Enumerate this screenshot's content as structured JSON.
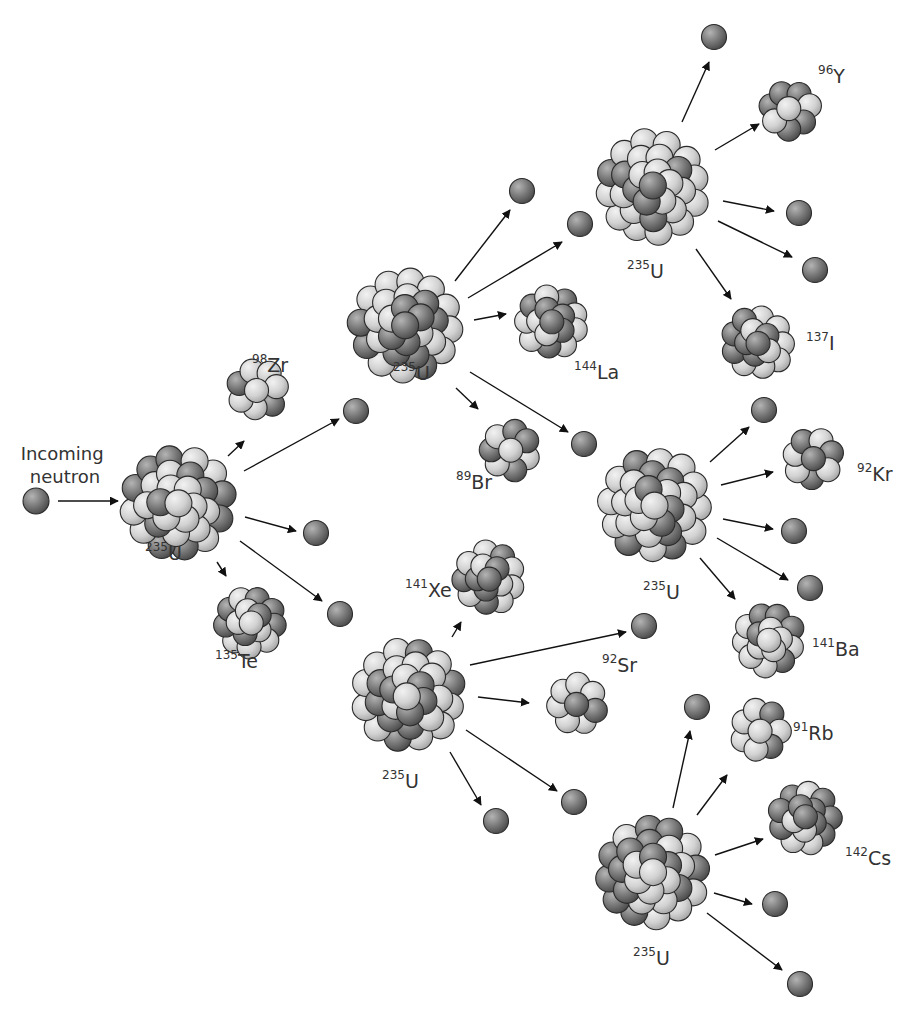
{
  "colors": {
    "background": "#ffffff",
    "proton_light": "#d6d6d6",
    "neutron_dark": "#7a7a7a",
    "outline": "#2a2a2a",
    "arrow": "#111111",
    "label": "#333333"
  },
  "caption": {
    "line1": "Incoming",
    "line2": "neutron",
    "x": 65,
    "y1": 460,
    "y2": 483
  },
  "incoming_neutron": {
    "x": 36,
    "y": 501
  },
  "nuclei": [
    {
      "id": "u1",
      "type": "large",
      "x": 178,
      "y": 503,
      "mass": "235",
      "symbol": "U",
      "lx": 145,
      "ly": 560
    },
    {
      "id": "zr98",
      "type": "small",
      "x": 258,
      "y": 390,
      "mass": "98",
      "symbol": "Zr",
      "lx": 252,
      "ly": 372
    },
    {
      "id": "te135",
      "type": "medium",
      "x": 250,
      "y": 622,
      "mass": "135",
      "symbol": "Te",
      "lx": 215,
      "ly": 668
    },
    {
      "id": "u2",
      "type": "large",
      "x": 406,
      "y": 326,
      "mass": "235",
      "symbol": "U",
      "lx": 393,
      "ly": 380
    },
    {
      "id": "la144",
      "type": "medium",
      "x": 552,
      "y": 322,
      "mass": "144",
      "symbol": "La",
      "lx": 574,
      "ly": 379
    },
    {
      "id": "br89",
      "type": "small",
      "x": 510,
      "y": 450,
      "mass": "89",
      "symbol": "Br",
      "lx": 456,
      "ly": 489
    },
    {
      "id": "u3",
      "type": "large",
      "x": 652,
      "y": 187,
      "mass": "235",
      "symbol": "U",
      "lx": 627,
      "ly": 278
    },
    {
      "id": "y96",
      "type": "small",
      "x": 790,
      "y": 110,
      "mass": "96",
      "symbol": "Y",
      "lx": 818,
      "ly": 83
    },
    {
      "id": "i137",
      "type": "medium",
      "x": 758,
      "y": 343,
      "mass": "137",
      "symbol": "I",
      "lx": 806,
      "ly": 350
    },
    {
      "id": "u4",
      "type": "large",
      "x": 655,
      "y": 505,
      "mass": "235",
      "symbol": "U",
      "lx": 643,
      "ly": 599
    },
    {
      "id": "kr92",
      "type": "small",
      "x": 813,
      "y": 458,
      "mass": "92",
      "symbol": "Kr",
      "lx": 857,
      "ly": 481
    },
    {
      "id": "ba141",
      "type": "medium",
      "x": 768,
      "y": 640,
      "mass": "141",
      "symbol": "Ba",
      "lx": 812,
      "ly": 656
    },
    {
      "id": "xe141",
      "type": "medium",
      "x": 489,
      "y": 578,
      "mass": "141",
      "symbol": "Xe",
      "lx": 405,
      "ly": 597
    },
    {
      "id": "u5",
      "type": "large",
      "x": 408,
      "y": 695,
      "mass": "235",
      "symbol": "U",
      "lx": 382,
      "ly": 788
    },
    {
      "id": "sr92",
      "type": "small",
      "x": 577,
      "y": 704,
      "mass": "92",
      "symbol": "Sr",
      "lx": 602,
      "ly": 672
    },
    {
      "id": "rb91",
      "type": "small",
      "x": 760,
      "y": 730,
      "mass": "91",
      "symbol": "Rb",
      "lx": 793,
      "ly": 740
    },
    {
      "id": "cs142",
      "type": "medium",
      "x": 805,
      "y": 818,
      "mass": "142",
      "symbol": "Cs",
      "lx": 845,
      "ly": 865
    },
    {
      "id": "u6",
      "type": "large",
      "x": 652,
      "y": 873,
      "mass": "235",
      "symbol": "U",
      "lx": 633,
      "ly": 965
    }
  ],
  "free_neutrons": [
    {
      "x": 356,
      "y": 411
    },
    {
      "x": 316,
      "y": 533
    },
    {
      "x": 340,
      "y": 614
    },
    {
      "x": 522,
      "y": 191
    },
    {
      "x": 580,
      "y": 224
    },
    {
      "x": 584,
      "y": 444
    },
    {
      "x": 714,
      "y": 37
    },
    {
      "x": 799,
      "y": 213
    },
    {
      "x": 815,
      "y": 270
    },
    {
      "x": 764,
      "y": 410
    },
    {
      "x": 794,
      "y": 531
    },
    {
      "x": 810,
      "y": 588
    },
    {
      "x": 644,
      "y": 626
    },
    {
      "x": 496,
      "y": 821
    },
    {
      "x": 574,
      "y": 802
    },
    {
      "x": 697,
      "y": 707
    },
    {
      "x": 775,
      "y": 904
    },
    {
      "x": 800,
      "y": 984
    }
  ],
  "arrows": [
    {
      "x1": 58,
      "y1": 501,
      "x2": 118,
      "y2": 501
    },
    {
      "x1": 228,
      "y1": 456,
      "x2": 244,
      "y2": 441
    },
    {
      "x1": 244,
      "y1": 471,
      "x2": 339,
      "y2": 419
    },
    {
      "x1": 245,
      "y1": 517,
      "x2": 296,
      "y2": 531
    },
    {
      "x1": 240,
      "y1": 541,
      "x2": 322,
      "y2": 601
    },
    {
      "x1": 217,
      "y1": 562,
      "x2": 226,
      "y2": 576
    },
    {
      "x1": 455,
      "y1": 281,
      "x2": 510,
      "y2": 210
    },
    {
      "x1": 468,
      "y1": 298,
      "x2": 562,
      "y2": 242
    },
    {
      "x1": 474,
      "y1": 320,
      "x2": 506,
      "y2": 314
    },
    {
      "x1": 470,
      "y1": 372,
      "x2": 568,
      "y2": 432
    },
    {
      "x1": 456,
      "y1": 388,
      "x2": 478,
      "y2": 409
    },
    {
      "x1": 682,
      "y1": 122,
      "x2": 709,
      "y2": 62
    },
    {
      "x1": 715,
      "y1": 150,
      "x2": 759,
      "y2": 124
    },
    {
      "x1": 723,
      "y1": 201,
      "x2": 774,
      "y2": 211
    },
    {
      "x1": 718,
      "y1": 221,
      "x2": 792,
      "y2": 257
    },
    {
      "x1": 696,
      "y1": 249,
      "x2": 731,
      "y2": 299
    },
    {
      "x1": 710,
      "y1": 462,
      "x2": 749,
      "y2": 427
    },
    {
      "x1": 721,
      "y1": 485,
      "x2": 773,
      "y2": 472
    },
    {
      "x1": 723,
      "y1": 519,
      "x2": 773,
      "y2": 529
    },
    {
      "x1": 717,
      "y1": 538,
      "x2": 788,
      "y2": 580
    },
    {
      "x1": 700,
      "y1": 558,
      "x2": 735,
      "y2": 599
    },
    {
      "x1": 452,
      "y1": 637,
      "x2": 461,
      "y2": 622
    },
    {
      "x1": 470,
      "y1": 665,
      "x2": 626,
      "y2": 632
    },
    {
      "x1": 478,
      "y1": 697,
      "x2": 529,
      "y2": 703
    },
    {
      "x1": 466,
      "y1": 730,
      "x2": 557,
      "y2": 791
    },
    {
      "x1": 450,
      "y1": 752,
      "x2": 481,
      "y2": 805
    },
    {
      "x1": 673,
      "y1": 808,
      "x2": 690,
      "y2": 731
    },
    {
      "x1": 697,
      "y1": 815,
      "x2": 727,
      "y2": 775
    },
    {
      "x1": 715,
      "y1": 855,
      "x2": 763,
      "y2": 839
    },
    {
      "x1": 714,
      "y1": 893,
      "x2": 752,
      "y2": 904
    },
    {
      "x1": 707,
      "y1": 913,
      "x2": 782,
      "y2": 970
    }
  ]
}
